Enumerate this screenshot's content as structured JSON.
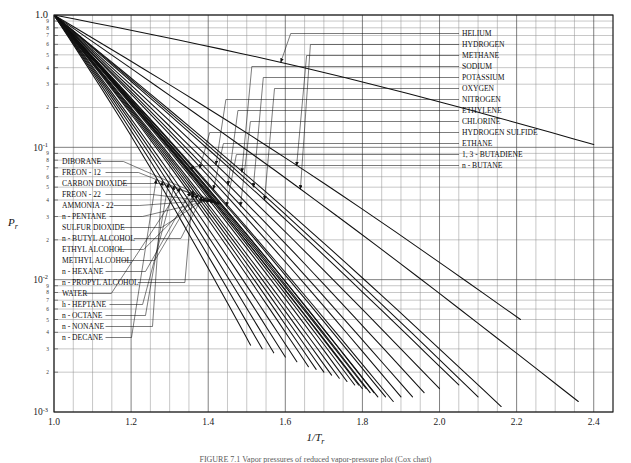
{
  "figure": {
    "caption": "FIGURE 7.1   Vapor pressures of reduced vapor-pressure plot (Cox chart)",
    "ylabel": "P",
    "ylabel_sub": "r",
    "xlabel": "1/T",
    "xlabel_sub": "r"
  },
  "chart_data": {
    "type": "line",
    "title": "",
    "xlabel": "1/Tr",
    "ylabel": "Pr",
    "xlim": [
      1.0,
      2.45
    ],
    "ylim": [
      0.001,
      1.0
    ],
    "yscale": "log",
    "xscale": "linear",
    "grid": true,
    "legend_position": "inline-labels",
    "x_ticks": [
      "1.0",
      "1.2",
      "1.4",
      "1.6",
      "1.8",
      "2.0",
      "2.2",
      "2.4"
    ],
    "x_tick_values": [
      1.0,
      1.2,
      1.4,
      1.6,
      1.8,
      2.0,
      2.2,
      2.4
    ],
    "x_minor_step": 0.05,
    "y_major_ticks": [
      "1.0",
      "10",
      "10",
      "10"
    ],
    "y_major_labels": [
      {
        "text": "1.0",
        "value": 1
      },
      {
        "text": "10",
        "sup": "-1",
        "value": 0.1
      },
      {
        "text": "10",
        "sup": "-2",
        "value": 0.01
      },
      {
        "text": "10",
        "sup": "-3",
        "value": 0.001
      }
    ],
    "y_minor_ticks": [
      "9",
      "8",
      "7",
      "6",
      "5",
      "4",
      "3",
      "2"
    ],
    "series": [
      {
        "name": "HELIUM",
        "label_side": "right",
        "slope_end_x": 2.4,
        "end_y": 0.105
      },
      {
        "name": "HYDROGEN",
        "label_side": "right",
        "slope_end_x": 2.36,
        "end_y": 0.0012
      },
      {
        "name": "METHANE",
        "label_side": "right",
        "slope_end_x": 2.21,
        "end_y": 0.005
      },
      {
        "name": "SODIUM",
        "label_side": "right",
        "slope_end_x": 2.16,
        "end_y": 0.0011
      },
      {
        "name": "POTASSIUM",
        "label_side": "right",
        "slope_end_x": 2.1,
        "end_y": 0.0013
      },
      {
        "name": "OXYGEN",
        "label_side": "right",
        "slope_end_x": 2.05,
        "end_y": 0.0016
      },
      {
        "name": "NITROGEN",
        "label_side": "right",
        "slope_end_x": 2.0,
        "end_y": 0.0015
      },
      {
        "name": "ETHYLENE",
        "label_side": "right",
        "slope_end_x": 1.96,
        "end_y": 0.0014
      },
      {
        "name": "CHLORINE",
        "label_side": "right",
        "slope_end_x": 1.93,
        "end_y": 0.0013
      },
      {
        "name": "HYDROGEN SULFIDE",
        "label_side": "right",
        "slope_end_x": 1.9,
        "end_y": 0.0013
      },
      {
        "name": "ETHANE",
        "label_side": "right",
        "slope_end_x": 1.88,
        "end_y": 0.0012
      },
      {
        "name": "1, 3 - BUTADIENE",
        "label_side": "right",
        "slope_end_x": 1.86,
        "end_y": 0.0013
      },
      {
        "name": "n - BUTANE",
        "label_side": "right",
        "slope_end_x": 1.84,
        "end_y": 0.0013
      },
      {
        "name": "DIBORANE",
        "label_side": "left",
        "slope_end_x": 1.83,
        "end_y": 0.0014
      },
      {
        "name": "FREON - 12",
        "label_side": "left",
        "slope_end_x": 1.82,
        "end_y": 0.0014
      },
      {
        "name": "CARBON DIOXIDE",
        "label_side": "left",
        "slope_end_x": 1.81,
        "end_y": 0.0015
      },
      {
        "name": "FREON - 22",
        "label_side": "left",
        "slope_end_x": 1.8,
        "end_y": 0.0015
      },
      {
        "name": "AMMONIA - 22",
        "label_side": "left",
        "slope_end_x": 1.79,
        "end_y": 0.0016
      },
      {
        "name": "n - PENTANE",
        "label_side": "left",
        "slope_end_x": 1.78,
        "end_y": 0.0016
      },
      {
        "name": "SULFUR DIOXIDE",
        "label_side": "left",
        "slope_end_x": 1.76,
        "end_y": 0.0017
      },
      {
        "name": "n - BUTYL ALCOHOL",
        "label_side": "left",
        "slope_end_x": 1.74,
        "end_y": 0.0018
      },
      {
        "name": "ETHYL ALCOHOL",
        "label_side": "left",
        "slope_end_x": 1.72,
        "end_y": 0.0019
      },
      {
        "name": "METHYL ALCOHOL",
        "label_side": "left",
        "slope_end_x": 1.7,
        "end_y": 0.002
      },
      {
        "name": "n - HEXANE",
        "label_side": "left",
        "slope_end_x": 1.68,
        "end_y": 0.0021
      },
      {
        "name": "n - PROPYL ALCOHOL",
        "label_side": "left",
        "slope_end_x": 1.66,
        "end_y": 0.0022
      },
      {
        "name": "WATER",
        "label_side": "left",
        "slope_end_x": 1.63,
        "end_y": 0.0024
      },
      {
        "name": "h - HEPTANE",
        "label_side": "left",
        "slope_end_x": 1.6,
        "end_y": 0.0026
      },
      {
        "name": "n - OCTANE",
        "label_side": "left",
        "slope_end_x": 1.57,
        "end_y": 0.0028
      },
      {
        "name": "n - NONANE",
        "label_side": "left",
        "slope_end_x": 1.54,
        "end_y": 0.003
      },
      {
        "name": "n - DECANE",
        "label_side": "left",
        "slope_end_x": 1.51,
        "end_y": 0.0032
      }
    ]
  },
  "left_labels": [
    {
      "text": "DIBORANE"
    },
    {
      "text": "FREON - 12"
    },
    {
      "text": "CARBON DIOXIDE"
    },
    {
      "text": "FREON - 22"
    },
    {
      "text": "AMMONIA - 22"
    },
    {
      "text": "n - PENTANE"
    },
    {
      "text": "SULFUR DIOXIDE"
    },
    {
      "text": "n - BUTYL ALCOHOL"
    },
    {
      "text": "ETHYL ALCOHOL"
    },
    {
      "text": "METHYL ALCOHOL"
    },
    {
      "text": "n - HEXANE"
    },
    {
      "text": "n - PROPYL ALCOHOL"
    },
    {
      "text": "WATER"
    },
    {
      "text": "h - HEPTANE"
    },
    {
      "text": "n - OCTANE"
    },
    {
      "text": "n - NONANE"
    },
    {
      "text": "n - DECANE"
    }
  ],
  "right_labels": [
    {
      "text": "HELIUM"
    },
    {
      "text": "HYDROGEN"
    },
    {
      "text": "METHANE"
    },
    {
      "text": "SODIUM"
    },
    {
      "text": "POTASSIUM"
    },
    {
      "text": "OXYGEN"
    },
    {
      "text": "NITROGEN"
    },
    {
      "text": "ETHYLENE"
    },
    {
      "text": "CHLORINE"
    },
    {
      "text": "HYDROGEN SULFIDE"
    },
    {
      "text": "ETHANE"
    },
    {
      "text": "1, 3 - BUTADIENE"
    },
    {
      "text": "n - BUTANE"
    }
  ],
  "colors": {
    "line": "#111111",
    "grid_major": "#4a4a4a",
    "grid_minor": "#8e8e8e",
    "axis": "#1a1a1a",
    "text": "#1a1a1a",
    "caption": "#5a5a5a",
    "background": "#ffffff"
  }
}
